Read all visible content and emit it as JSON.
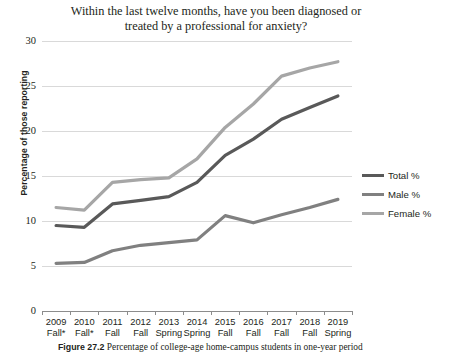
{
  "chart_data": {
    "type": "line",
    "title": "Within the last twelve months, have you been diagnosed or treated by a professional for anxiety?",
    "title_line1": "Within the last twelve months, have you been diagnosed or",
    "title_line2": "treated by a professional for anxiety?",
    "xlabel": "",
    "ylabel": "Percentage of those reporting",
    "ylim": [
      0,
      30
    ],
    "yticks": [
      0,
      5,
      10,
      15,
      20,
      25,
      30
    ],
    "ytick_labels": [
      "0",
      "5",
      "10",
      "15",
      "20",
      "25",
      "30"
    ],
    "grid": true,
    "legend_position": "right",
    "categories": [
      "2009 Fall*",
      "2010 Fall*",
      "2011 Fall",
      "2012 Fall",
      "2013 Spring",
      "2014 Spring",
      "2015 Fall",
      "2016 Fall",
      "2017 Fall",
      "2018 Fall",
      "2019 Spring"
    ],
    "category_lines": [
      [
        "2009",
        "Fall*"
      ],
      [
        "2010",
        "Fall*"
      ],
      [
        "2011",
        "Fall"
      ],
      [
        "2012",
        "Fall"
      ],
      [
        "2013",
        "Spring"
      ],
      [
        "2014",
        "Spring"
      ],
      [
        "2015",
        "Fall"
      ],
      [
        "2016",
        "Fall"
      ],
      [
        "2017",
        "Fall"
      ],
      [
        "2018",
        "Fall"
      ],
      [
        "2019",
        "Spring"
      ]
    ],
    "series": [
      {
        "name": "Total %",
        "color": "#595959",
        "values": [
          9.5,
          9.3,
          11.9,
          12.3,
          12.7,
          14.3,
          17.3,
          19.1,
          21.3,
          22.6,
          23.9
        ]
      },
      {
        "name": "Male %",
        "color": "#808080",
        "values": [
          5.3,
          5.4,
          6.7,
          7.3,
          7.6,
          7.9,
          10.6,
          9.8,
          10.7,
          11.5,
          12.4
        ]
      },
      {
        "name": "Female %",
        "color": "#a6a6a6",
        "values": [
          11.5,
          11.2,
          14.3,
          14.6,
          14.8,
          16.9,
          20.4,
          23.0,
          26.1,
          27.0,
          27.7
        ]
      }
    ]
  },
  "legend": {
    "items": [
      {
        "label": "Total %",
        "color": "#595959"
      },
      {
        "label": "Male %",
        "color": "#808080"
      },
      {
        "label": "Female %",
        "color": "#a6a6a6"
      }
    ]
  },
  "caption": {
    "figure_number": "Figure 27.2",
    "text": "Percentage of college-age home-campus students in one-year period"
  }
}
